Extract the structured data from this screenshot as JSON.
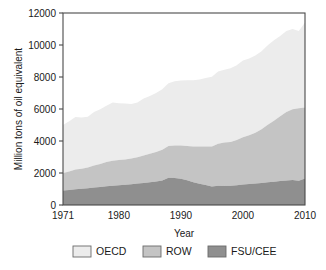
{
  "chart_data": {
    "type": "area",
    "stacked": true,
    "title": "",
    "xlabel": "Year",
    "ylabel": "Million tons of oil equivalent",
    "xlim": [
      1971,
      2010
    ],
    "ylim": [
      0,
      12000
    ],
    "grid": false,
    "legend_position": "bottom",
    "x_ticks": [
      "1971",
      "1980",
      "1990",
      "2000",
      "2010"
    ],
    "x_tick_values": [
      1971,
      1980,
      1990,
      2000,
      2010
    ],
    "y_ticks": [
      "0",
      "2000",
      "4000",
      "6000",
      "8000",
      "10000",
      "12000"
    ],
    "y_tick_values": [
      0,
      2000,
      4000,
      6000,
      8000,
      10000,
      12000
    ],
    "x": [
      1971,
      1972,
      1973,
      1974,
      1975,
      1976,
      1977,
      1978,
      1979,
      1980,
      1981,
      1982,
      1983,
      1984,
      1985,
      1986,
      1987,
      1988,
      1989,
      1990,
      1991,
      1992,
      1993,
      1994,
      1995,
      1996,
      1997,
      1998,
      1999,
      2000,
      2001,
      2002,
      2003,
      2004,
      2005,
      2006,
      2007,
      2008,
      2009,
      2010
    ],
    "series": [
      {
        "name": "FSU/CEE",
        "color": "#8f8f8f",
        "values": [
          900,
          940,
          980,
          1010,
          1050,
          1090,
          1130,
          1170,
          1200,
          1240,
          1270,
          1300,
          1340,
          1380,
          1420,
          1470,
          1530,
          1700,
          1680,
          1640,
          1540,
          1420,
          1330,
          1250,
          1150,
          1210,
          1190,
          1200,
          1230,
          1280,
          1320,
          1340,
          1380,
          1420,
          1450,
          1500,
          1530,
          1570,
          1520,
          1650
        ]
      },
      {
        "name": "ROW",
        "color": "#c4c4c4",
        "values": [
          1100,
          1160,
          1240,
          1250,
          1290,
          1380,
          1440,
          1510,
          1570,
          1580,
          1580,
          1600,
          1640,
          1720,
          1790,
          1850,
          1920,
          1980,
          2040,
          2080,
          2150,
          2230,
          2320,
          2400,
          2500,
          2620,
          2710,
          2740,
          2830,
          2960,
          3040,
          3180,
          3350,
          3600,
          3820,
          4040,
          4280,
          4420,
          4530,
          4450
        ]
      },
      {
        "name": "OECD",
        "color": "#ececec",
        "values": [
          3000,
          3140,
          3280,
          3210,
          3180,
          3340,
          3420,
          3520,
          3630,
          3540,
          3490,
          3420,
          3420,
          3550,
          3610,
          3680,
          3780,
          3930,
          4010,
          4060,
          4110,
          4150,
          4190,
          4280,
          4370,
          4510,
          4560,
          4600,
          4680,
          4790,
          4790,
          4830,
          4880,
          4970,
          5020,
          5020,
          5060,
          5010,
          4830,
          5300
        ]
      }
    ],
    "cumulative_tops": {
      "FSU/CEE": [
        900,
        940,
        980,
        1010,
        1050,
        1090,
        1130,
        1170,
        1200,
        1240,
        1270,
        1300,
        1340,
        1380,
        1420,
        1470,
        1530,
        1700,
        1680,
        1640,
        1540,
        1420,
        1330,
        1250,
        1150,
        1210,
        1190,
        1200,
        1230,
        1280,
        1320,
        1340,
        1380,
        1420,
        1450,
        1500,
        1530,
        1570,
        1520,
        1650
      ],
      "ROW": [
        2000,
        2100,
        2220,
        2260,
        2340,
        2470,
        2570,
        2680,
        2770,
        2820,
        2850,
        2900,
        2980,
        3100,
        3210,
        3320,
        3450,
        3680,
        3720,
        3720,
        3690,
        3650,
        3650,
        3650,
        3650,
        3830,
        3900,
        3940,
        4060,
        4240,
        4360,
        4520,
        4730,
        5020,
        5270,
        5540,
        5810,
        5990,
        6050,
        6100
      ],
      "OECD": [
        5000,
        5240,
        5500,
        5470,
        5520,
        5810,
        5990,
        6200,
        6400,
        6360,
        6340,
        6320,
        6400,
        6650,
        6820,
        7000,
        7230,
        7610,
        7730,
        7780,
        7800,
        7800,
        7840,
        7930,
        8020,
        8340,
        8460,
        8540,
        8740,
        9030,
        9150,
        9350,
        9610,
        9990,
        10290,
        10560,
        10870,
        11000,
        10880,
        11400
      ]
    },
    "annotations": []
  },
  "legend": {
    "entries": [
      {
        "label": "OECD",
        "swatch": "#ececec"
      },
      {
        "label": "ROW",
        "swatch": "#c4c4c4"
      },
      {
        "label": "FSU/CEE",
        "swatch": "#8f8f8f"
      }
    ]
  },
  "axes": {
    "x_title": "Year",
    "y_title": "Million tons of oil equivalent"
  }
}
